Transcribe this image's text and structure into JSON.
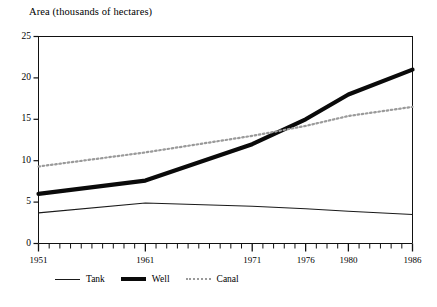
{
  "chart_data": {
    "type": "line",
    "title": "",
    "ylabel": "Area (thousands of hectares)",
    "xlabel": "",
    "ylim": [
      0,
      25
    ],
    "yticks": [
      0,
      5,
      10,
      15,
      20,
      25
    ],
    "ytick_labels": [
      "0",
      "5",
      "10",
      "15",
      "20",
      "25"
    ],
    "xlim": [
      1951,
      1986
    ],
    "xticks": [
      1951,
      1961,
      1971,
      1976,
      1980,
      1986
    ],
    "xtick_labels": [
      "1951",
      "1961",
      "1971",
      "1976",
      "1980",
      "1986"
    ],
    "xminor_tick_interval": 1,
    "grid": false,
    "legend_position": "below-axis-left",
    "x": [
      1951,
      1961,
      1971,
      1976,
      1980,
      1986
    ],
    "series": [
      {
        "name": "Tank",
        "style": "thin-solid",
        "color": "#1a1a1a",
        "values": [
          3.7,
          4.9,
          4.5,
          4.2,
          3.9,
          3.5
        ]
      },
      {
        "name": "Well",
        "style": "thick-solid",
        "color": "#0a0a0a",
        "values": [
          6.0,
          7.6,
          12.0,
          15.0,
          18.0,
          21.0
        ]
      },
      {
        "name": "Canal",
        "style": "dotted",
        "color": "#9a9a9a",
        "values": [
          9.3,
          11.0,
          13.0,
          14.2,
          15.4,
          16.5
        ]
      }
    ],
    "annotations": [
      "Well line crosses above Canal line near 1976"
    ]
  },
  "legend": {
    "items": [
      {
        "label": "Tank",
        "swatch": "thin-line-swatch"
      },
      {
        "label": "Well",
        "swatch": "thick-line-swatch"
      },
      {
        "label": "Canal",
        "swatch": "dotted-line-swatch"
      }
    ]
  }
}
